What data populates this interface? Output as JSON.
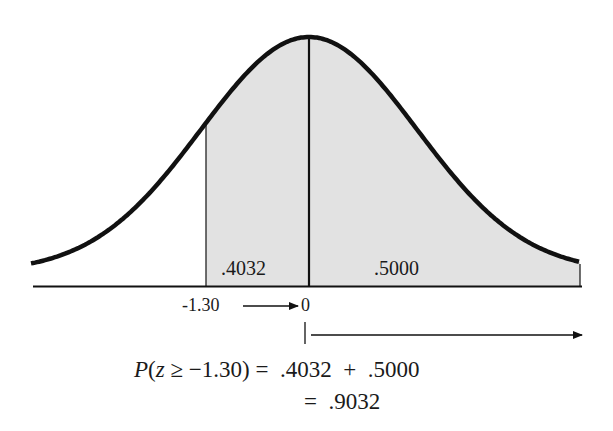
{
  "chart_data": {
    "type": "area",
    "title": "",
    "xlabel": "",
    "ylabel": "",
    "x_ticks": [
      "-1.30",
      "0"
    ],
    "shaded_regions": [
      {
        "from": -1.3,
        "to": 0,
        "area": ".4032"
      },
      {
        "from": 0,
        "to": "infinity",
        "area": ".5000"
      }
    ],
    "total_area": ".9032",
    "grid": false
  },
  "labels": {
    "area_left": ".4032",
    "area_right": ".5000",
    "tick_z": "-1.30",
    "tick_zero": "0"
  },
  "equation": {
    "p_prefix": "P",
    "open": "(",
    "var": "z",
    "rel": " ≥ −1.30) ",
    "line1_rhs": "=  .4032  +  .5000",
    "line2_rhs": "=  .9032"
  },
  "colors": {
    "curve": "#111111",
    "shade": "#e2e2e2",
    "axis": "#111111"
  }
}
